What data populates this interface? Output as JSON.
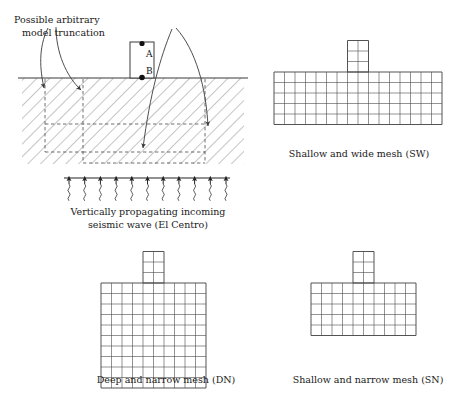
{
  "figure": {
    "domain_panel": {
      "annotation_label_line1": "Possible arbitrary",
      "annotation_label_line2": "model truncation",
      "structure_point_top": "A",
      "structure_point_bottom": "B",
      "wave_caption_line1": "Vertically propagating incoming",
      "wave_caption_line2": "seismic wave (El Centro)",
      "wave_arrow_count": 11,
      "hatch_angle_deg": 45,
      "ground_line_y": 78,
      "truncation_style": "dashed",
      "colors": {
        "line": "#3a3a3a",
        "hatch": "#6e6e6e",
        "dashed": "#555555",
        "text": "#1a1a1a"
      }
    },
    "meshes": [
      {
        "id": "sw",
        "caption": "Shallow and wide mesh (SW)",
        "slab_cols": 16,
        "slab_rows": 5,
        "tower_cols": 2,
        "tower_rows": 3,
        "cell_w": 10.5,
        "cell_h": 10.5,
        "origin_x": 274,
        "origin_y": 72
      },
      {
        "id": "dn",
        "caption": "Deep and narrow mesh (DN)",
        "slab_cols": 10,
        "slab_rows": 10,
        "tower_cols": 2,
        "tower_rows": 3,
        "cell_w": 10.5,
        "cell_h": 10.5,
        "origin_x": 101,
        "origin_y": 283
      },
      {
        "id": "sn",
        "caption": "Shallow and narrow mesh (SN)",
        "slab_cols": 10,
        "slab_rows": 5,
        "tower_cols": 2,
        "tower_rows": 3,
        "cell_w": 10.5,
        "cell_h": 10.5,
        "origin_x": 311,
        "origin_y": 283
      }
    ],
    "mesh_colors": {
      "grid": "#4a4a4a",
      "outline": "#3a3a3a"
    }
  }
}
